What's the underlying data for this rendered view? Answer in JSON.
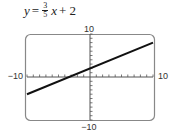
{
  "equation": {
    "lhs": "y",
    "equals": "=",
    "frac_num": "3",
    "frac_den": "5",
    "var": "x",
    "rest": "+ 2"
  },
  "axis_labels": {
    "ymax": "10",
    "ymin": "−10",
    "xmin": "−10",
    "xmax": "10"
  },
  "chart_data": {
    "type": "line",
    "xlabel": "",
    "ylabel": "",
    "xlim": [
      -10,
      10
    ],
    "ylim": [
      -10,
      10
    ],
    "xticks_step": 1,
    "yticks_step": 1,
    "grid": false,
    "series": [
      {
        "name": "y = (3/5)x + 2",
        "slope": 0.6,
        "intercept": 2,
        "x": [
          -10,
          10
        ],
        "y": [
          -4,
          8
        ]
      }
    ],
    "colors": {
      "line": "#111111",
      "axes": "#555555",
      "frame": "#888888"
    }
  }
}
